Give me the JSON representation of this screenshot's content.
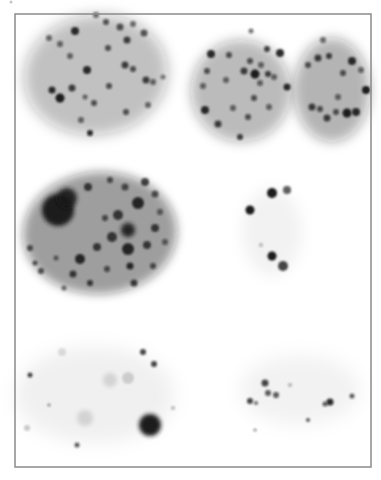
{
  "figure": {
    "width": 381,
    "height": 480,
    "background": "#ffffff",
    "frame": {
      "x": 15,
      "y": 14,
      "w": 356,
      "h": 453,
      "stroke": "#8a8a8a",
      "stroke_width": 1.5
    },
    "foreground_color": "#1a1a1a"
  },
  "nuclei": [
    {
      "name": "nucleus-top-left",
      "cx": 96,
      "cy": 75,
      "rx": 72,
      "ry": 60,
      "rotate": -8,
      "opacity": 0.28,
      "blur": 7,
      "foci": [
        [
          96,
          15,
          3,
          0.6
        ],
        [
          106,
          22,
          3,
          0.7
        ],
        [
          75,
          31,
          4,
          0.9
        ],
        [
          120,
          27,
          3.5,
          0.7
        ],
        [
          133,
          24,
          3,
          0.6
        ],
        [
          144,
          33,
          3.5,
          0.7
        ],
        [
          49,
          38,
          3,
          0.6
        ],
        [
          60,
          44,
          3,
          0.6
        ],
        [
          127,
          40,
          3.5,
          0.8
        ],
        [
          108,
          48,
          3,
          0.7
        ],
        [
          70,
          56,
          3,
          0.6
        ],
        [
          87,
          70,
          4,
          0.9
        ],
        [
          125,
          65,
          3.5,
          0.8
        ],
        [
          133,
          69,
          3,
          0.7
        ],
        [
          146,
          80,
          3.5,
          0.8
        ],
        [
          153,
          82,
          3,
          0.6
        ],
        [
          52,
          90,
          3.5,
          0.9
        ],
        [
          60,
          98,
          4.5,
          1.0
        ],
        [
          72,
          88,
          3.5,
          0.8
        ],
        [
          109,
          86,
          3,
          0.7
        ],
        [
          85,
          97,
          2.5,
          0.6
        ],
        [
          94,
          103,
          3,
          0.7
        ],
        [
          148,
          105,
          3,
          0.6
        ],
        [
          126,
          112,
          3,
          0.7
        ],
        [
          81,
          120,
          3,
          0.6
        ],
        [
          90,
          133,
          3,
          0.9
        ],
        [
          163,
          77,
          2.5,
          0.5
        ]
      ]
    },
    {
      "name": "nucleus-top-middle",
      "cx": 241,
      "cy": 91,
      "rx": 50,
      "ry": 51,
      "rotate": 0,
      "opacity": 0.3,
      "blur": 6,
      "foci": [
        [
          251,
          31,
          2.5,
          0.6
        ],
        [
          211,
          54,
          4,
          0.9
        ],
        [
          267,
          49,
          3,
          0.8
        ],
        [
          280,
          53,
          4,
          0.9
        ],
        [
          250,
          61,
          3,
          0.7
        ],
        [
          229,
          55,
          3,
          0.7
        ],
        [
          261,
          65,
          3,
          0.6
        ],
        [
          244,
          71,
          3.5,
          0.8
        ],
        [
          255,
          74,
          4.5,
          1.0
        ],
        [
          268,
          74,
          3,
          0.8
        ],
        [
          207,
          71,
          3,
          0.7
        ],
        [
          203,
          86,
          3,
          0.6
        ],
        [
          287,
          87,
          3.5,
          0.9
        ],
        [
          274,
          77,
          3,
          0.6
        ],
        [
          260,
          83,
          3,
          0.6
        ],
        [
          254,
          98,
          3,
          0.7
        ],
        [
          205,
          110,
          4,
          0.9
        ],
        [
          218,
          124,
          3.5,
          0.8
        ],
        [
          248,
          117,
          3,
          0.7
        ],
        [
          233,
          108,
          3,
          0.6
        ],
        [
          240,
          137,
          3,
          0.8
        ],
        [
          269,
          107,
          3,
          0.6
        ],
        [
          226,
          80,
          3,
          0.6
        ]
      ]
    },
    {
      "name": "nucleus-top-right",
      "cx": 332,
      "cy": 90,
      "rx": 38,
      "ry": 52,
      "rotate": 0,
      "opacity": 0.33,
      "blur": 6,
      "foci": [
        [
          323,
          40,
          3,
          0.6
        ],
        [
          318,
          58,
          3.5,
          0.8
        ],
        [
          329,
          56,
          3,
          0.8
        ],
        [
          352,
          61,
          4,
          0.9
        ],
        [
          308,
          65,
          3,
          0.7
        ],
        [
          343,
          73,
          3,
          0.7
        ],
        [
          361,
          70,
          3,
          0.6
        ],
        [
          312,
          107,
          3.5,
          0.8
        ],
        [
          320,
          109,
          3,
          0.7
        ],
        [
          327,
          118,
          3.5,
          0.8
        ],
        [
          336,
          112,
          3,
          0.7
        ],
        [
          347,
          113,
          4.5,
          1.0
        ],
        [
          356,
          112,
          4,
          0.9
        ],
        [
          366,
          90,
          4,
          1.0
        ],
        [
          338,
          97,
          3,
          0.6
        ]
      ]
    },
    {
      "name": "nucleus-middle-left",
      "cx": 100,
      "cy": 233,
      "rx": 77,
      "ry": 61,
      "rotate": -3,
      "opacity": 0.42,
      "blur": 5,
      "foci": [
        [
          58,
          210,
          16,
          1.0
        ],
        [
          67,
          198,
          10,
          0.9
        ],
        [
          88,
          187,
          4,
          0.8
        ],
        [
          110,
          180,
          3,
          0.7
        ],
        [
          125,
          187,
          3.5,
          0.7
        ],
        [
          145,
          182,
          4,
          0.8
        ],
        [
          155,
          194,
          3.5,
          0.7
        ],
        [
          138,
          203,
          6,
          0.9
        ],
        [
          118,
          215,
          5,
          0.8
        ],
        [
          128,
          230,
          7,
          0.95
        ],
        [
          112,
          237,
          5,
          0.8
        ],
        [
          97,
          247,
          4,
          0.8
        ],
        [
          80,
          259,
          5,
          0.9
        ],
        [
          128,
          249,
          6,
          0.9
        ],
        [
          147,
          245,
          4,
          0.8
        ],
        [
          155,
          228,
          4,
          0.8
        ],
        [
          160,
          212,
          3,
          0.6
        ],
        [
          30,
          248,
          3,
          0.7
        ],
        [
          35,
          263,
          2.5,
          0.7
        ],
        [
          41,
          271,
          3,
          0.7
        ],
        [
          56,
          258,
          2.5,
          0.6
        ],
        [
          73,
          274,
          3.5,
          0.8
        ],
        [
          90,
          283,
          3,
          0.8
        ],
        [
          107,
          269,
          3,
          0.7
        ],
        [
          130,
          266,
          3.5,
          0.9
        ],
        [
          134,
          283,
          3.5,
          0.8
        ],
        [
          153,
          266,
          3,
          0.7
        ],
        [
          64,
          288,
          2.5,
          0.6
        ],
        [
          105,
          218,
          3,
          0.7
        ],
        [
          165,
          242,
          3,
          0.6
        ]
      ]
    },
    {
      "name": "nucleus-middle-right",
      "cx": 272,
      "cy": 232,
      "rx": 30,
      "ry": 44,
      "rotate": 0,
      "opacity": 0.05,
      "blur": 7,
      "foci": [
        [
          272,
          193,
          5,
          1.0
        ],
        [
          287,
          190,
          4,
          0.7
        ],
        [
          250,
          210,
          4.5,
          1.0
        ],
        [
          261,
          245,
          2,
          0.3
        ],
        [
          272,
          256,
          4.5,
          1.0
        ],
        [
          283,
          266,
          5,
          0.8
        ]
      ]
    },
    {
      "name": "nucleus-bottom-left",
      "cx": 95,
      "cy": 395,
      "rx": 80,
      "ry": 48,
      "rotate": 0,
      "opacity": 0.06,
      "blur": 9,
      "foci": [
        [
          150,
          425,
          11,
          1.0
        ],
        [
          143,
          352,
          3,
          0.8
        ],
        [
          154,
          364,
          3,
          0.8
        ],
        [
          30,
          375,
          2.5,
          0.8
        ],
        [
          77,
          445,
          2.5,
          0.7
        ],
        [
          49,
          405,
          1.5,
          0.5
        ],
        [
          128,
          378,
          6,
          0.15
        ],
        [
          110,
          380,
          7,
          0.12
        ],
        [
          85,
          418,
          8,
          0.12
        ],
        [
          62,
          352,
          4,
          0.12
        ],
        [
          173,
          408,
          2,
          0.3
        ],
        [
          27,
          428,
          3,
          0.2
        ]
      ]
    },
    {
      "name": "nucleus-bottom-right",
      "cx": 300,
      "cy": 390,
      "rx": 60,
      "ry": 35,
      "rotate": 0,
      "opacity": 0.05,
      "blur": 9,
      "foci": [
        [
          265,
          383,
          3.5,
          0.8
        ],
        [
          268,
          393,
          3,
          0.7
        ],
        [
          276,
          395,
          3,
          0.7
        ],
        [
          250,
          401,
          3,
          0.8
        ],
        [
          256,
          403,
          2,
          0.6
        ],
        [
          330,
          402,
          3.5,
          0.9
        ],
        [
          325,
          404,
          2.5,
          0.7
        ],
        [
          352,
          396,
          2.5,
          0.7
        ],
        [
          308,
          420,
          2,
          0.7
        ],
        [
          255,
          430,
          1.5,
          0.5
        ],
        [
          290,
          385,
          2,
          0.3
        ]
      ]
    }
  ],
  "artifacts": [
    [
      11,
      2,
      1.5,
      0.25
    ]
  ]
}
